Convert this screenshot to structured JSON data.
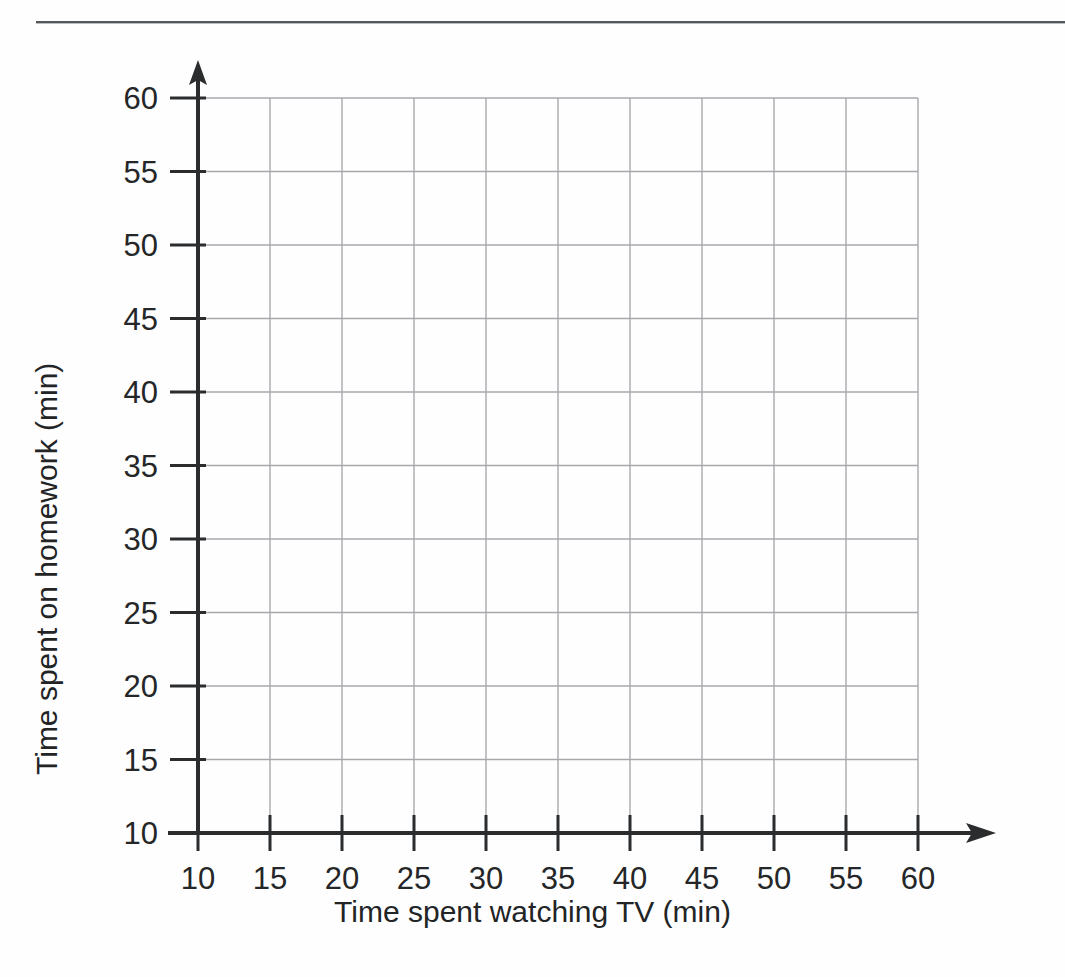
{
  "page": {
    "background_color": "#fefefe",
    "rule_color": "#56585c",
    "ghost_left": "",
    "ghost_right": ""
  },
  "chart_data": {
    "type": "scatter",
    "title": "",
    "subtitle": "",
    "xlabel": "Time spent watching TV (min)",
    "ylabel": "Time spent on homework (min)",
    "xlim": [
      10,
      60
    ],
    "ylim": [
      10,
      60
    ],
    "xticks": [
      10,
      15,
      20,
      25,
      30,
      35,
      40,
      45,
      50,
      55,
      60
    ],
    "yticks": [
      10,
      15,
      20,
      25,
      30,
      35,
      40,
      45,
      50,
      55,
      60
    ],
    "xticklabels": [
      "10",
      "15",
      "20",
      "25",
      "30",
      "35",
      "40",
      "45",
      "50",
      "55",
      "60"
    ],
    "yticklabels": [
      "10",
      "15",
      "20",
      "25",
      "30",
      "35",
      "40",
      "45",
      "50",
      "55",
      "60"
    ],
    "tick_step": 5,
    "grid": true,
    "grid_color": "#a6a8ac",
    "axis_color": "#2a2c2e",
    "legend": false,
    "legend_position": "none",
    "series": [
      {
        "name": "",
        "points": []
      }
    ],
    "annotations": [],
    "note": "Empty coordinate grid — no data points are plotted."
  },
  "axes": {
    "x_arrow": true,
    "y_arrow": true
  }
}
